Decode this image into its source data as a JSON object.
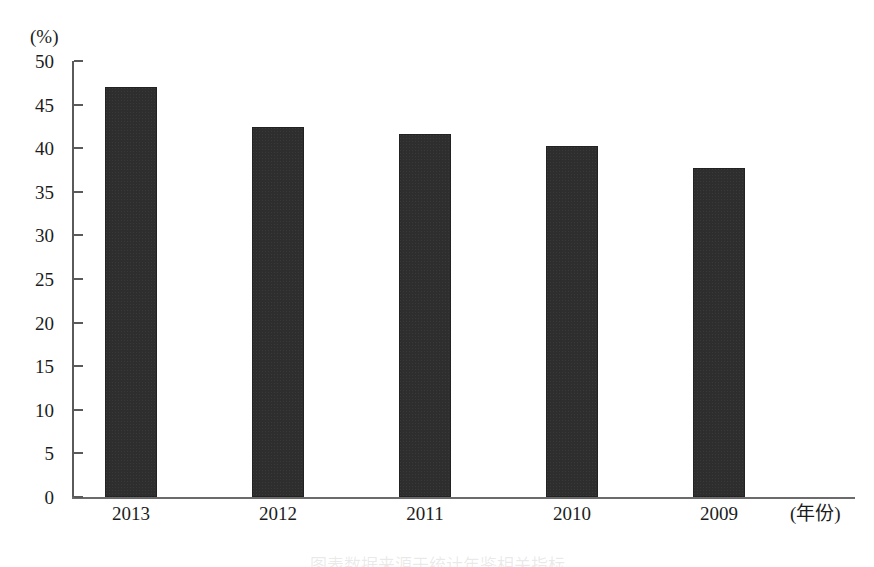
{
  "chart_data": {
    "type": "bar",
    "title": "",
    "subtitle": "",
    "xlabel": "(年份)",
    "ylabel": "(%)",
    "categories": [
      "2013",
      "2012",
      "2011",
      "2010",
      "2009"
    ],
    "values": [
      47.0,
      42.4,
      41.6,
      40.3,
      37.7
    ],
    "series": [
      {
        "name": "",
        "values": [
          47.0,
          42.4,
          41.6,
          40.3,
          37.7
        ]
      }
    ],
    "ylim": [
      0,
      50
    ],
    "ytick_labels": [
      "50",
      "45",
      "40",
      "35",
      "30",
      "25",
      "20",
      "15",
      "10",
      "5",
      "0"
    ],
    "ytick_values": [
      50,
      45,
      40,
      35,
      30,
      25,
      20,
      15,
      10,
      5,
      0
    ],
    "ytick_step": 5,
    "grid": false,
    "legend": null,
    "legend_position": "none",
    "bar_color": "#2e2e2e",
    "axis_color": "#5a5a5a",
    "background_color": "#ffffff",
    "annotations": []
  },
  "axis": {
    "y_unit_label": "(%)",
    "x_unit_label": "(年份)"
  },
  "caption": {
    "bottom_text": "图表数据来源于统计年鉴相关指标"
  }
}
